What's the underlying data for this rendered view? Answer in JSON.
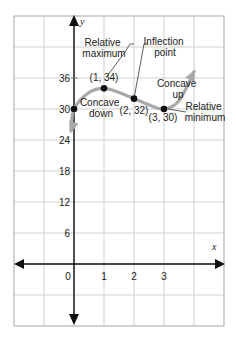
{
  "chart_data": {
    "type": "line",
    "title": "",
    "xlabel": "x",
    "ylabel": "y",
    "xlim": [
      -2,
      5
    ],
    "ylim": [
      -12,
      48
    ],
    "x_ticks": [
      {
        "value": 0,
        "label": "0"
      },
      {
        "value": 1,
        "label": "1"
      },
      {
        "value": 2,
        "label": "2"
      },
      {
        "value": 3,
        "label": "3"
      }
    ],
    "y_ticks": [
      {
        "value": 6,
        "label": "6"
      },
      {
        "value": 12,
        "label": "12"
      },
      {
        "value": 18,
        "label": "18"
      },
      {
        "value": 24,
        "label": "24"
      },
      {
        "value": 30,
        "label": "30"
      },
      {
        "value": 36,
        "label": "36"
      }
    ],
    "grid": true,
    "curve": {
      "name": "f(x)",
      "color": "#a9a9a9",
      "x": [
        -0.1,
        0,
        0.5,
        1,
        1.5,
        2,
        2.5,
        3,
        3.5,
        4.0
      ],
      "y": [
        25.8,
        30,
        33.2,
        34,
        33.2,
        32,
        30.8,
        30,
        31.6,
        37.2
      ]
    },
    "points": [
      {
        "x": 0,
        "y": 30,
        "label": ""
      },
      {
        "x": 1,
        "y": 34,
        "label": "(1, 34)"
      },
      {
        "x": 2,
        "y": 32,
        "label": "(2, 32)"
      },
      {
        "x": 3,
        "y": 30,
        "label": "(3, 30)"
      }
    ],
    "annotations": [
      {
        "id": "relmax",
        "lines": [
          "Relative",
          "maximum"
        ]
      },
      {
        "id": "inflection",
        "lines": [
          "Inflection",
          "point"
        ]
      },
      {
        "id": "concave-down",
        "lines": [
          "Concave",
          "down"
        ]
      },
      {
        "id": "concave-up",
        "lines": [
          "Concave",
          "up"
        ]
      },
      {
        "id": "relmin",
        "lines": [
          "Relative",
          "minimum"
        ]
      }
    ]
  }
}
